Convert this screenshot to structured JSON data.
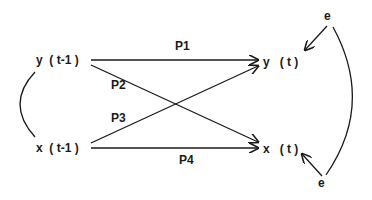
{
  "nodes": {
    "y_prev": "y  ( t-1 )",
    "x_prev": "x  ( t-1 )",
    "y_curr": "y   ( t )",
    "x_curr": "x   ( t )",
    "e_top": "e",
    "e_bottom": "e"
  },
  "paths": {
    "p1": "P1",
    "p2": "P2",
    "p3": "P3",
    "p4": "P4"
  },
  "colors": {
    "line": "#1a1a1a",
    "background": "#ffffff"
  }
}
